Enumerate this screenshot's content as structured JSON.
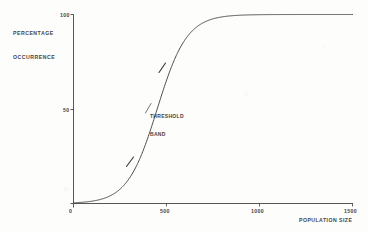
{
  "figure": {
    "background_color": "#fdfdfc",
    "line_color": "#4a4a4a",
    "text_color": "#2a2a2a"
  },
  "axes": {
    "y_title_line1": "PERCENTAGE",
    "y_title_line2": "OCCURRENCE",
    "x_title": "POPULATION SIZE",
    "y_tick_100": "100",
    "y_tick_50": "50",
    "origin": "0",
    "x_tick_500": "500",
    "x_tick_1000": "1000",
    "x_tick_1500": "1500"
  },
  "annotations": {
    "threshold_line1": "THRESHOLD",
    "threshold_line2": "BAND"
  },
  "chart_data": {
    "type": "line",
    "title": "",
    "subtitle": "",
    "xlabel": "POPULATION SIZE",
    "ylabel": "PERCENTAGE OCCURRENCE",
    "xlim": [
      0,
      1500
    ],
    "ylim": [
      0,
      100
    ],
    "xticks": [
      0,
      500,
      1000,
      1500
    ],
    "xticklabels": [
      "0",
      "500",
      "1000",
      "1500"
    ],
    "yticks": [
      0,
      50,
      100
    ],
    "yticklabels": [
      "0",
      "50",
      "100"
    ],
    "grid": false,
    "legend": false,
    "legend_position": "none",
    "series": [
      {
        "name": "percentage occurrence",
        "curve": "logistic sigmoid",
        "midpoint_x": 450,
        "steepness_k": 0.0125,
        "x": [
          0,
          50,
          100,
          150,
          200,
          250,
          300,
          350,
          400,
          450,
          500,
          550,
          600,
          650,
          700,
          750,
          800,
          900,
          1000,
          1100,
          1200,
          1300,
          1400,
          1500
        ],
        "y": [
          0.4,
          0.7,
          1.3,
          2.3,
          4.2,
          7.4,
          12.8,
          21.4,
          33.2,
          47.5,
          62.2,
          74.9,
          84.5,
          90.9,
          94.8,
          97.1,
          98.4,
          99.5,
          99.8,
          99.9,
          100,
          100,
          100,
          100
        ]
      }
    ],
    "annotations": [
      {
        "label": "THRESHOLD BAND",
        "type": "band-marker-pair",
        "marker_lower": {
          "x": 290,
          "y": 11.5
        },
        "marker_upper": {
          "x": 560,
          "y": 76.5
        },
        "description": "two short tick marks across the curve bracketing the steep transition region"
      }
    ]
  }
}
